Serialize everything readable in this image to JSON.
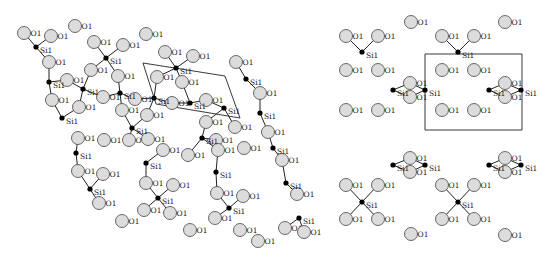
{
  "figure": {
    "colors": {
      "oxygen_fill": "#dcdcdc",
      "oxygen_stroke": "#444444",
      "silicon": "#000000",
      "bond": "#222222"
    },
    "labels": {
      "oxygen": "O1",
      "silicon": "Si1"
    }
  },
  "panels": [
    {
      "name": "left-projection",
      "unit_cell": [
        [
          143,
          63
        ],
        [
          225,
          76
        ],
        [
          240,
          118
        ],
        [
          156,
          104
        ]
      ],
      "silicon": [
        [
          36,
          47
        ],
        [
          83,
          89
        ],
        [
          106,
          58
        ],
        [
          49,
          82
        ],
        [
          62,
          118
        ],
        [
          76,
          153
        ],
        [
          90,
          189
        ],
        [
          120,
          93
        ],
        [
          132,
          128
        ],
        [
          146,
          163
        ],
        [
          158,
          198
        ],
        [
          154,
          98
        ],
        [
          176,
          68
        ],
        [
          190,
          103
        ],
        [
          202,
          138
        ],
        [
          216,
          172
        ],
        [
          229,
          208
        ],
        [
          224,
          108
        ],
        [
          246,
          79
        ],
        [
          260,
          113
        ],
        [
          273,
          148
        ],
        [
          286,
          183
        ],
        [
          299,
          218
        ]
      ],
      "oxygen": [
        [
          24,
          33
        ],
        [
          51,
          36
        ],
        [
          75,
          26
        ],
        [
          146,
          34
        ],
        [
          49,
          62
        ],
        [
          67,
          80
        ],
        [
          94,
          42
        ],
        [
          123,
          45
        ],
        [
          91,
          70
        ],
        [
          118,
          76
        ],
        [
          165,
          52
        ],
        [
          193,
          56
        ],
        [
          157,
          77
        ],
        [
          182,
          82
        ],
        [
          103,
          97
        ],
        [
          135,
          99
        ],
        [
          172,
          103
        ],
        [
          206,
          100
        ],
        [
          52,
          100
        ],
        [
          79,
          107
        ],
        [
          122,
          110
        ],
        [
          147,
          115
        ],
        [
          206,
          122
        ],
        [
          216,
          140
        ],
        [
          236,
          62
        ],
        [
          260,
          93
        ],
        [
          78,
          138
        ],
        [
          104,
          140
        ],
        [
          129,
          140
        ],
        [
          148,
          139
        ],
        [
          163,
          150
        ],
        [
          188,
          155
        ],
        [
          235,
          127
        ],
        [
          268,
          132
        ],
        [
          78,
          171
        ],
        [
          103,
          174
        ],
        [
          146,
          183
        ],
        [
          173,
          185
        ],
        [
          218,
          150
        ],
        [
          244,
          148
        ],
        [
          217,
          193
        ],
        [
          243,
          196
        ],
        [
          99,
          203
        ],
        [
          144,
          210
        ],
        [
          170,
          213
        ],
        [
          215,
          218
        ],
        [
          240,
          230
        ],
        [
          282,
          160
        ],
        [
          297,
          194
        ],
        [
          285,
          228
        ],
        [
          304,
          232
        ],
        [
          122,
          221
        ],
        [
          190,
          230
        ],
        [
          258,
          241
        ]
      ]
    },
    {
      "name": "right-projection",
      "unit_cell": [
        [
          425,
          54
        ],
        [
          522,
          54
        ],
        [
          522,
          130
        ],
        [
          425,
          130
        ]
      ],
      "silicon": [
        [
          362,
          52
        ],
        [
          458,
          52
        ],
        [
          393,
          90
        ],
        [
          425,
          90
        ],
        [
          489,
          90
        ],
        [
          521,
          90
        ],
        [
          362,
          202
        ],
        [
          458,
          202
        ],
        [
          393,
          165
        ],
        [
          425,
          165
        ],
        [
          489,
          165
        ],
        [
          521,
          165
        ]
      ],
      "oxygen": [
        [
          411,
          22
        ],
        [
          505,
          22
        ],
        [
          346,
          36
        ],
        [
          378,
          36
        ],
        [
          442,
          36
        ],
        [
          474,
          36
        ],
        [
          346,
          70
        ],
        [
          378,
          70
        ],
        [
          442,
          70
        ],
        [
          474,
          70
        ],
        [
          410,
          83
        ],
        [
          410,
          97
        ],
        [
          505,
          83
        ],
        [
          505,
          97
        ],
        [
          346,
          110
        ],
        [
          378,
          110
        ],
        [
          442,
          110
        ],
        [
          474,
          110
        ],
        [
          346,
          185
        ],
        [
          378,
          185
        ],
        [
          442,
          185
        ],
        [
          474,
          185
        ],
        [
          410,
          158
        ],
        [
          410,
          172
        ],
        [
          505,
          158
        ],
        [
          505,
          172
        ],
        [
          346,
          219
        ],
        [
          378,
          219
        ],
        [
          442,
          219
        ],
        [
          474,
          219
        ],
        [
          411,
          234
        ],
        [
          505,
          235
        ]
      ]
    }
  ]
}
